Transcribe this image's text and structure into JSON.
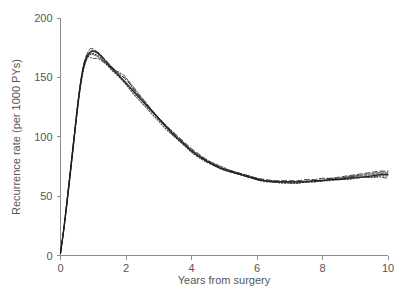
{
  "chart_data": {
    "type": "line",
    "title": "",
    "subtitle": "",
    "xlabel": "Years from surgery",
    "ylabel": "Recurrence rate (per 1000 PYs)",
    "xlim": [
      0,
      10
    ],
    "ylim": [
      0,
      200
    ],
    "xticks": [
      0,
      2,
      4,
      6,
      8,
      10
    ],
    "xtick_labels": [
      "0",
      "2",
      "4",
      "6",
      "8",
      "10"
    ],
    "yticks": [
      0,
      50,
      100,
      150,
      200
    ],
    "ytick_labels": [
      "0",
      "50",
      "100",
      "150",
      "200"
    ],
    "grid": false,
    "legend": false,
    "legend_position": "none",
    "annotations": [],
    "x": [
      0.0,
      0.1,
      0.2,
      0.3,
      0.4,
      0.5,
      0.6,
      0.7,
      0.8,
      0.9,
      1.0,
      1.1,
      1.2,
      1.3,
      1.4,
      1.5,
      1.6,
      1.8,
      2.0,
      2.2,
      2.4,
      2.6,
      2.8,
      3.0,
      3.2,
      3.4,
      3.6,
      3.8,
      4.0,
      4.25,
      4.5,
      4.75,
      5.0,
      5.25,
      5.5,
      5.75,
      6.0,
      6.25,
      6.5,
      6.75,
      7.0,
      7.25,
      7.5,
      7.75,
      8.0,
      8.25,
      8.5,
      8.75,
      9.0,
      9.25,
      9.5,
      9.75,
      10.0
    ],
    "series": [
      {
        "name": "Model run 1",
        "style": "solid",
        "values": [
          2,
          22,
          45,
          70,
          95,
          120,
          142,
          158,
          167,
          171,
          172,
          171,
          169,
          166,
          163,
          160,
          157,
          151,
          145,
          139,
          133,
          127,
          121,
          115,
          109,
          103,
          98,
          93,
          88,
          83,
          79,
          75,
          72,
          70,
          68,
          66,
          64,
          63,
          62,
          62,
          62,
          62,
          62,
          63,
          63,
          64,
          64,
          65,
          66,
          66,
          67,
          68,
          68
        ]
      },
      {
        "name": "Model run 2",
        "style": "dashed",
        "values": [
          2,
          23,
          47,
          72,
          97,
          122,
          144,
          160,
          169,
          174,
          174,
          172,
          170,
          167,
          164,
          161,
          158,
          153,
          148,
          142,
          135,
          129,
          122,
          116,
          110,
          105,
          100,
          95,
          90,
          85,
          80,
          76,
          73,
          71,
          69,
          67,
          65,
          64,
          63,
          63,
          63,
          63,
          64,
          64,
          65,
          65,
          66,
          67,
          68,
          69,
          70,
          71,
          71
        ]
      },
      {
        "name": "Model run 3",
        "style": "dotted",
        "values": [
          2,
          21,
          44,
          68,
          93,
          118,
          140,
          156,
          165,
          169,
          170,
          169,
          167,
          164,
          161,
          158,
          155,
          150,
          144,
          137,
          131,
          125,
          119,
          113,
          107,
          102,
          97,
          92,
          87,
          82,
          78,
          75,
          72,
          70,
          68,
          66,
          64,
          62,
          62,
          61,
          61,
          61,
          62,
          62,
          63,
          63,
          64,
          64,
          65,
          66,
          66,
          67,
          67
        ]
      },
      {
        "name": "Model run 4",
        "style": "dashdot",
        "values": [
          2,
          22,
          46,
          71,
          96,
          121,
          143,
          159,
          168,
          167,
          166,
          166,
          165,
          163,
          161,
          159,
          157,
          154,
          150,
          141,
          134,
          128,
          122,
          116,
          110,
          104,
          99,
          94,
          89,
          84,
          79,
          76,
          73,
          71,
          69,
          67,
          65,
          63,
          62,
          62,
          61,
          61,
          62,
          62,
          63,
          64,
          64,
          65,
          65,
          66,
          66,
          66,
          65
        ]
      },
      {
        "name": "Model run 5",
        "style": "solid-thin",
        "values": [
          2,
          22,
          45,
          69,
          94,
          119,
          141,
          157,
          166,
          170,
          169,
          168,
          166,
          164,
          162,
          159,
          156,
          151,
          146,
          140,
          134,
          128,
          122,
          115,
          109,
          104,
          98,
          93,
          88,
          83,
          79,
          76,
          73,
          70,
          68,
          66,
          64,
          63,
          62,
          62,
          62,
          62,
          62,
          63,
          63,
          64,
          65,
          66,
          67,
          68,
          69,
          70,
          70
        ]
      },
      {
        "name": "Model run 6",
        "style": "dashed-fine",
        "values": [
          2,
          23,
          46,
          71,
          96,
          121,
          143,
          159,
          168,
          172,
          173,
          171,
          168,
          165,
          162,
          159,
          156,
          152,
          149,
          143,
          136,
          129,
          122,
          116,
          110,
          105,
          99,
          94,
          89,
          84,
          80,
          77,
          74,
          71,
          69,
          67,
          65,
          63,
          63,
          62,
          62,
          62,
          63,
          63,
          64,
          65,
          65,
          66,
          67,
          67,
          68,
          69,
          69
        ]
      }
    ]
  },
  "figure": {
    "background_color": "#ffffff",
    "line_color": "#1d1d1d",
    "axis_color": "#8a8b8f",
    "text_color": "#55565a"
  }
}
